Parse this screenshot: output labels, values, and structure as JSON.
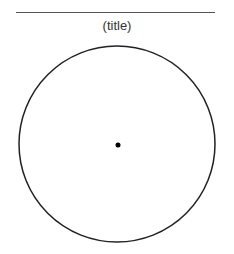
{
  "figure": {
    "title": "(title)",
    "circle": {
      "cx": 117,
      "cy": 144,
      "r": 98,
      "stroke": "#222222"
    },
    "center_point": {
      "cx": 118,
      "cy": 145,
      "r": 2.5,
      "fill": "#000000"
    },
    "rule_color": "#555555"
  }
}
